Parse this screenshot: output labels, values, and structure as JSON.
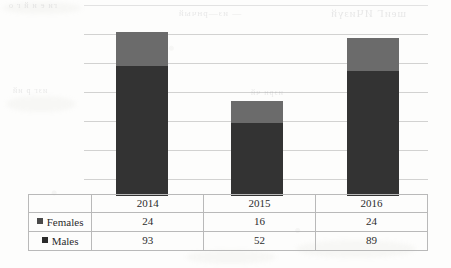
{
  "chart_data": {
    "type": "bar",
    "title": "",
    "subtitle": "",
    "xlabel": "",
    "ylabel": "",
    "stacked": true,
    "grid": true,
    "gridlines": 6,
    "legend_position": "left-table",
    "axis_tick_labels": [],
    "categories": [
      "2014",
      "2015",
      "2016"
    ],
    "series": [
      {
        "name": "Females",
        "values": [
          24,
          16,
          24
        ],
        "color": "#6b6b6b"
      },
      {
        "name": "Males",
        "values": [
          93,
          52,
          89
        ],
        "color": "#333333"
      }
    ],
    "totals": [
      117,
      68,
      113
    ],
    "ylim": [
      0,
      140
    ]
  },
  "table": {
    "header_blank_label": "",
    "columns": [
      "2014",
      "2015",
      "2016"
    ],
    "rows": [
      {
        "label": "Females",
        "marker": "legend-swatch-females",
        "color": "#4a4a4a",
        "values": [
          "24",
          "16",
          "24"
        ]
      },
      {
        "label": "Males",
        "marker": "legend-swatch-males",
        "color": "#2b2b2b",
        "values": [
          "93",
          "52",
          "89"
        ]
      }
    ]
  },
  "scan_artifacts": {
    "bleed_text_1": "— из—рнчый",
    "bleed_text_2": "шеиГ ИЧизүй",
    "bleed_text_3": "ги е и й г о",
    "bleed_text_4": "изг р ий",
    "bleed_text_5": "изрн чй"
  },
  "colors": {
    "females_bar": "#6b6b6b",
    "males_bar": "#333333",
    "gridline": "#969696",
    "table_border": "#b9b9b9",
    "page": "#fdfdfc"
  }
}
